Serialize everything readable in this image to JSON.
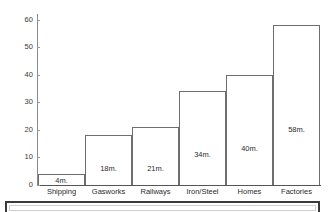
{
  "chart_data": {
    "type": "bar",
    "title": "",
    "xlabel": "",
    "ylabel": "",
    "categories": [
      "Shipping",
      "Gasworks",
      "Railways",
      "Iron/Steel",
      "Homes",
      "Factories"
    ],
    "values": [
      4,
      18,
      21,
      34,
      40,
      58
    ],
    "value_labels": [
      "4m.",
      "18m.",
      "21m.",
      "34m.",
      "40m.",
      "58m."
    ],
    "ylim": [
      0,
      62
    ],
    "y_ticks": [
      0,
      10,
      20,
      30,
      40,
      50,
      60
    ],
    "y_tick_labels": [
      "0",
      "10",
      "20",
      "30",
      "40",
      "50",
      "60"
    ],
    "grid": false,
    "legend": false,
    "legend_position": "none",
    "bar_fill_color": "#ffffff",
    "bar_border_color": "#6e6e6e",
    "axis_color": "#8a8a8a",
    "text_color": "#2b2b2b"
  }
}
